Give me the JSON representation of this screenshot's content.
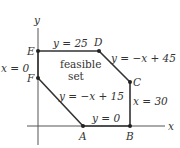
{
  "diagram": {
    "type": "linear-programming-feasible-region",
    "axes": {
      "x_label": "x",
      "y_label": "y"
    },
    "region_label_line1": "feasible",
    "region_label_line2": "set",
    "vertices": {
      "A": "A",
      "B": "B",
      "C": "C",
      "D": "D",
      "E": "E",
      "F": "F"
    },
    "constraints": {
      "top": "y = 25",
      "upper_right": "y = −x + 45",
      "right": "x = 30",
      "bottom": "y = 0",
      "left": "x = 0",
      "lower_left": "y = −x + 15"
    },
    "colors": {
      "line": "#333333",
      "axis": "#555555",
      "point": "#222222"
    }
  }
}
